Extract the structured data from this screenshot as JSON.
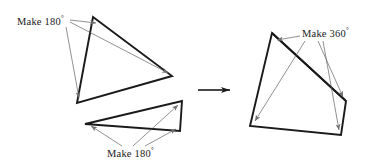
{
  "figure": {
    "width": 366,
    "height": 166,
    "background": "#ffffff",
    "stroke_heavy": "#1a1a1a",
    "stroke_light": "#8a8a8a",
    "heavy_width": 1.9,
    "light_width": 0.6
  },
  "labels": {
    "make180_top": {
      "text": "Make 180",
      "degree": "°",
      "x": 17,
      "y": 15
    },
    "make180_bottom": {
      "text": "Make 180",
      "degree": "°",
      "x": 107,
      "y": 147
    },
    "make360": {
      "text": "Make 360",
      "degree": "°",
      "x": 302,
      "y": 27
    }
  },
  "shapes": {
    "triangle_upper_left": {
      "name": "upper-left-triangle",
      "points": "93,17 172,76 77,103",
      "vertices": [
        {
          "x": 93,
          "y": 17
        },
        {
          "x": 172,
          "y": 76
        },
        {
          "x": 77,
          "y": 103
        }
      ]
    },
    "triangle_lower_left": {
      "name": "lower-left-triangle",
      "points": "85,124 182,101 180,131",
      "vertices": [
        {
          "x": 85,
          "y": 124
        },
        {
          "x": 182,
          "y": 101
        },
        {
          "x": 180,
          "y": 131
        }
      ]
    },
    "quadrilateral_right": {
      "name": "right-quadrilateral",
      "points": "272,33 346,101 341,135 250,126",
      "vertices": [
        {
          "x": 272,
          "y": 33
        },
        {
          "x": 346,
          "y": 101
        },
        {
          "x": 341,
          "y": 135
        },
        {
          "x": 250,
          "y": 126
        }
      ],
      "diagonal": {
        "x1": 272,
        "y1": 33,
        "x2": 346,
        "y2": 101
      }
    }
  },
  "leaders": {
    "upper_left": [
      {
        "name": "leader-to-top-vertex",
        "x1": 70,
        "y1": 20,
        "x2": 96,
        "y2": 23
      },
      {
        "name": "leader-to-right-vertex",
        "x1": 70,
        "y1": 22,
        "x2": 168,
        "y2": 73
      },
      {
        "name": "leader-to-bottom-vertex",
        "x1": 66,
        "y1": 27,
        "x2": 79,
        "y2": 98
      }
    ],
    "lower_left": [
      {
        "name": "leader-to-left-vertex",
        "x1": 122,
        "y1": 146,
        "x2": 91,
        "y2": 126
      },
      {
        "name": "leader-to-top-vertex",
        "x1": 133,
        "y1": 146,
        "x2": 178,
        "y2": 105
      },
      {
        "name": "leader-to-bottom-vertex",
        "x1": 145,
        "y1": 146,
        "x2": 176,
        "y2": 129
      }
    ],
    "right_quad": [
      {
        "name": "leader-to-top-vertex",
        "x1": 300,
        "y1": 36,
        "x2": 277,
        "y2": 40
      },
      {
        "name": "leader-to-bottomleft",
        "x1": 305,
        "y1": 41,
        "x2": 255,
        "y2": 121
      },
      {
        "name": "leader-to-rightmid",
        "x1": 318,
        "y1": 41,
        "x2": 343,
        "y2": 97
      },
      {
        "name": "leader-to-bottomright",
        "x1": 323,
        "y1": 41,
        "x2": 339,
        "y2": 130
      }
    ]
  },
  "transition_arrow": {
    "name": "transition-arrow",
    "x1": 198,
    "y1": 90,
    "x2": 232,
    "y2": 90
  }
}
